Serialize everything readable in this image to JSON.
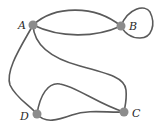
{
  "graph": {
    "type": "multigraph",
    "colors": {
      "edge": "#5a5a5a",
      "node": "#8c8c8c",
      "label": "#2a2a2a"
    },
    "nodes": [
      {
        "id": "A",
        "label": "A"
      },
      {
        "id": "B",
        "label": "B"
      },
      {
        "id": "C",
        "label": "C"
      },
      {
        "id": "D",
        "label": "D"
      }
    ],
    "edges": [
      {
        "from": "A",
        "to": "B",
        "shape": "upper-arc"
      },
      {
        "from": "A",
        "to": "B",
        "shape": "lower-arc"
      },
      {
        "from": "B",
        "to": "B",
        "shape": "loop"
      },
      {
        "from": "A",
        "to": "D",
        "shape": "curve"
      },
      {
        "from": "A",
        "to": "C",
        "shape": "s-curve"
      },
      {
        "from": "D",
        "to": "C",
        "shape": "upper-arc"
      },
      {
        "from": "D",
        "to": "C",
        "shape": "lower-arc"
      }
    ]
  }
}
